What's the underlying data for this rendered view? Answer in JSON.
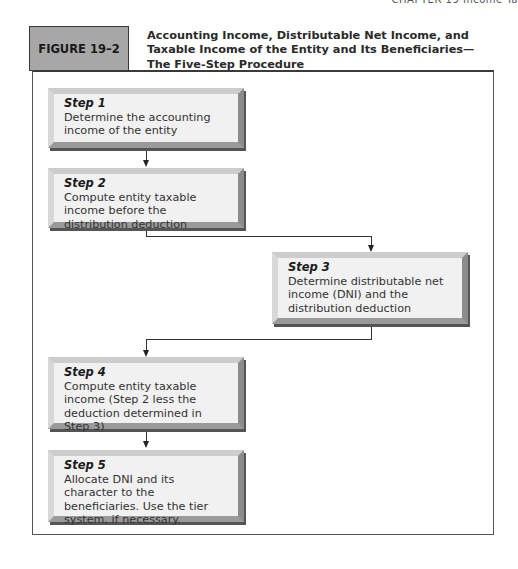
{
  "page": {
    "running_head": "CHAPTER 19  Income Ta"
  },
  "figure": {
    "label": "FIGURE 19–2",
    "title": "Accounting Income, Distributable Net Income, and Taxable Income of the Entity and Its Beneficiaries—The Five-Step Procedure",
    "colors": {
      "label_bg": "#a7a7a7",
      "box_bg": "#f1f1f1",
      "frame_border": "#555555"
    },
    "steps": [
      {
        "title": "Step 1",
        "text": "Determine the accounting income of the entity"
      },
      {
        "title": "Step 2",
        "text": "Compute entity taxable income before the distribution deduction"
      },
      {
        "title": "Step 3",
        "text": "Determine distributable net income (DNI) and the distribution deduction"
      },
      {
        "title": "Step 4",
        "text": "Compute entity taxable income (Step 2 less the deduction determined in Step 3)"
      },
      {
        "title": "Step 5",
        "text": "Allocate DNI and its character to the beneficiaries. Use the tier system, if necessary."
      }
    ],
    "flow": [
      {
        "from": "Step 1",
        "to": "Step 2"
      },
      {
        "from": "Step 2",
        "to": "Step 3"
      },
      {
        "from": "Step 3",
        "to": "Step 4"
      },
      {
        "from": "Step 4",
        "to": "Step 5"
      }
    ]
  }
}
